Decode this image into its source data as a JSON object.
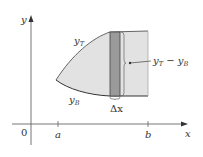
{
  "diagram": {
    "type": "area-between-curves",
    "axes": {
      "x_label": "x",
      "y_label": "y",
      "origin_label": "0"
    },
    "ticks": [
      {
        "label": "a",
        "x": 58
      },
      {
        "label": "b",
        "x": 148
      }
    ],
    "curves": {
      "top": {
        "label": "y",
        "subscript": "T"
      },
      "bottom": {
        "label": "y",
        "subscript": "B"
      }
    },
    "strip": {
      "width_label": "Δx",
      "height_label": {
        "main1": "y",
        "sub1": "T",
        "op": " − ",
        "main2": "y",
        "sub2": "B"
      }
    },
    "colors": {
      "region_fill": "#e2e2e2",
      "strip_fill": "#9a9a9a",
      "curve_stroke": "#555555",
      "axis_stroke": "#666666",
      "text": "#333333"
    }
  }
}
